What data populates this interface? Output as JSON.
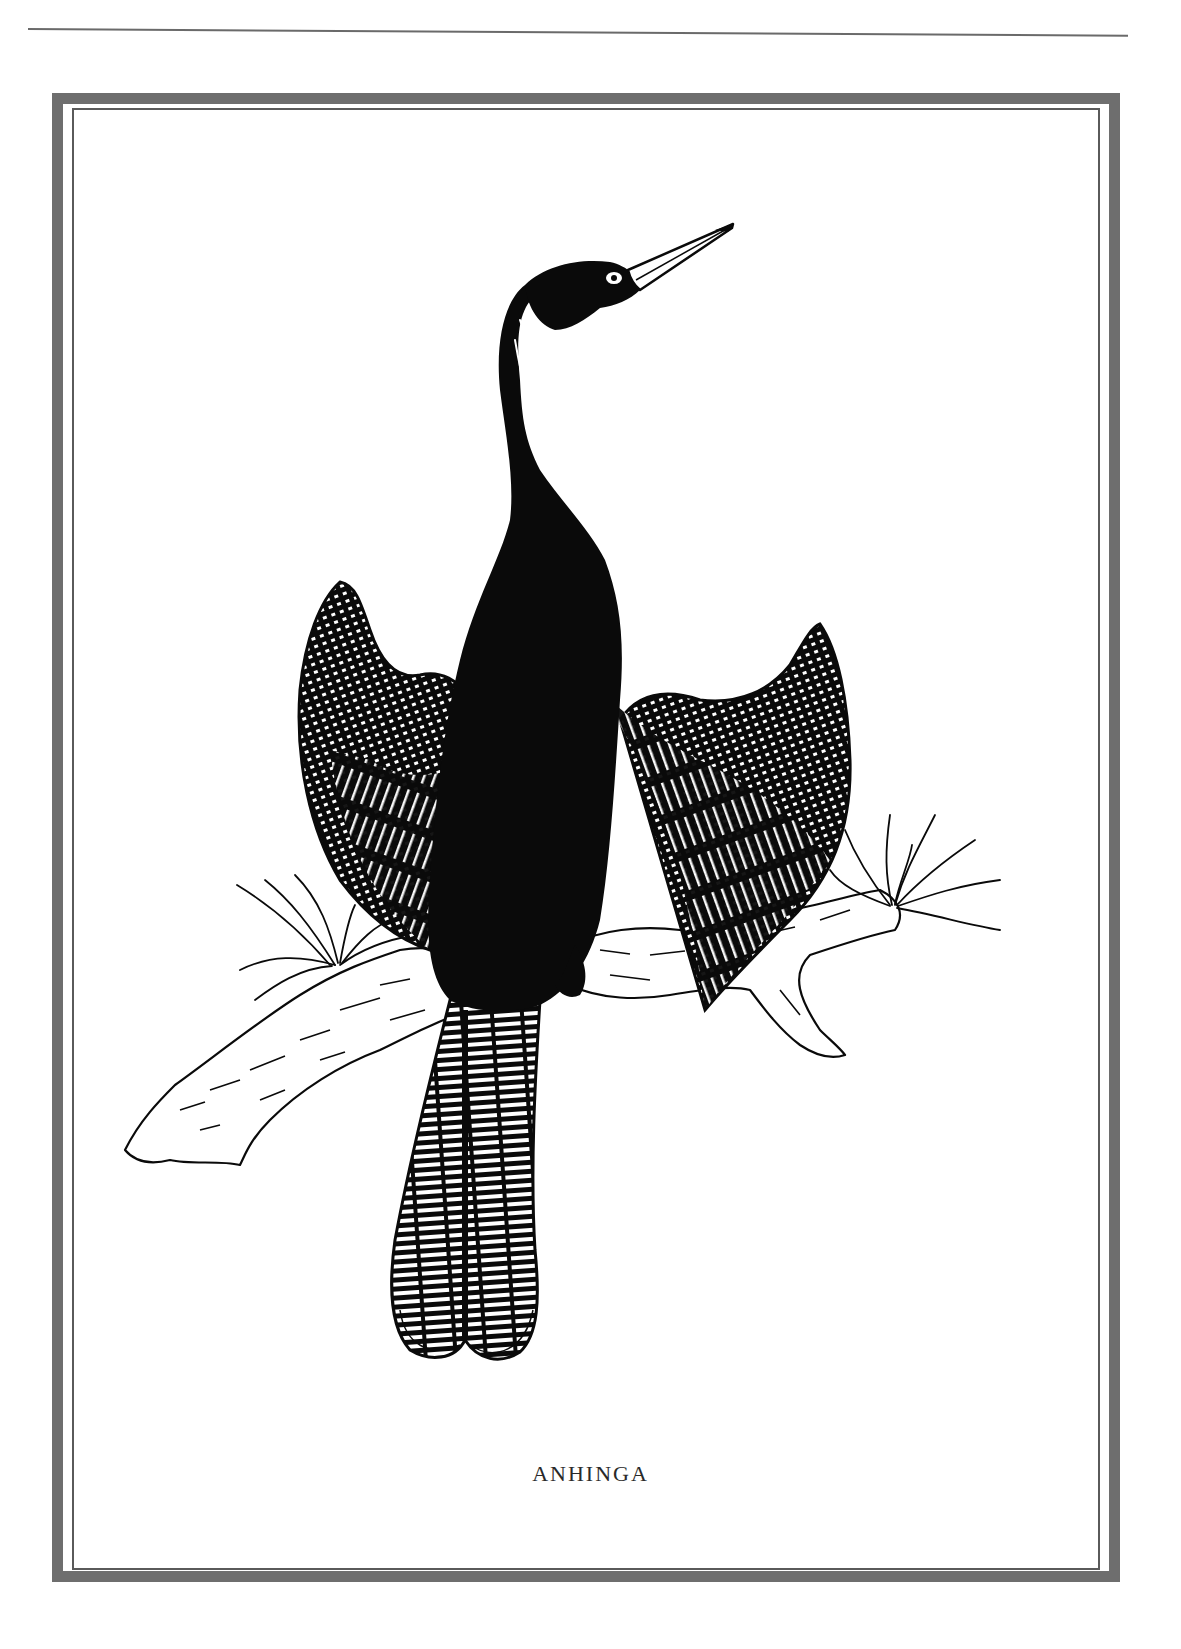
{
  "page": {
    "header_rule": true,
    "frame": {
      "outer_color": "#6e6e6e",
      "inner_line_color": "#5a5a5a"
    }
  },
  "plate": {
    "caption": "ANHINGA",
    "subject": "anhinga-bird-perched-on-branch-with-wings-spread",
    "ink_color": "#0a0a0a",
    "paper_color": "#ffffff"
  }
}
